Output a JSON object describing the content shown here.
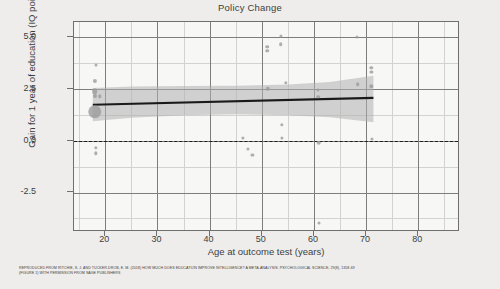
{
  "chart_data": {
    "type": "scatter",
    "title": "Policy Change",
    "xlabel": "Age at outcome test (years)",
    "ylabel": "Gain for 1 year of education\n(IQ points)",
    "ylabel_line1": "Gain for 1 year of education",
    "ylabel_line2": "(IQ points)",
    "xlim": [
      14,
      88
    ],
    "ylim": [
      -4.4,
      5.7
    ],
    "xticks": [
      20,
      30,
      40,
      50,
      60,
      70,
      80
    ],
    "xtick_labels": [
      "20",
      "30",
      "40",
      "50",
      "60",
      "70",
      "80"
    ],
    "yticks": [
      -2.5,
      0.0,
      2.5,
      5.0
    ],
    "ytick_labels": [
      "-2.5",
      "0.0",
      "2.5",
      "5.0"
    ],
    "x_minor_step": 5,
    "y_minor_step": 1.25,
    "grid": true,
    "legend": "none",
    "zero_reference_line": 0.0,
    "zero_line_style": "dashed",
    "regression_line": {
      "x_start": 17.6,
      "y_start": 1.72,
      "x_end": 71.4,
      "y_end": 2.05,
      "color": "#1a1a1a"
    },
    "confidence_band": {
      "color": "#b0b0b0",
      "opacity": 0.55,
      "upper": [
        {
          "x": 17.6,
          "y": 2.52
        },
        {
          "x": 25.0,
          "y": 2.6
        },
        {
          "x": 35.0,
          "y": 2.62
        },
        {
          "x": 45.0,
          "y": 2.63
        },
        {
          "x": 55.0,
          "y": 2.7
        },
        {
          "x": 63.0,
          "y": 2.82
        },
        {
          "x": 71.4,
          "y": 3.12
        }
      ],
      "lower": [
        {
          "x": 17.6,
          "y": 0.93
        },
        {
          "x": 25.0,
          "y": 1.1
        },
        {
          "x": 35.0,
          "y": 1.22
        },
        {
          "x": 45.0,
          "y": 1.26
        },
        {
          "x": 55.0,
          "y": 1.22
        },
        {
          "x": 63.0,
          "y": 1.12
        },
        {
          "x": 71.4,
          "y": 0.88
        }
      ]
    },
    "points": [
      {
        "x": 18.3,
        "y": 3.62,
        "size": 3.0
      },
      {
        "x": 18.0,
        "y": 2.88,
        "size": 4.2
      },
      {
        "x": 18.0,
        "y": 2.38,
        "size": 5.6
      },
      {
        "x": 18.0,
        "y": 2.12,
        "size": 4.0
      },
      {
        "x": 19.0,
        "y": 2.12,
        "size": 3.4
      },
      {
        "x": 18.0,
        "y": 1.38,
        "size": 13.5
      },
      {
        "x": 18.2,
        "y": -0.34,
        "size": 3.4
      },
      {
        "x": 18.2,
        "y": -0.62,
        "size": 3.4
      },
      {
        "x": 46.4,
        "y": 0.13,
        "size": 3.2
      },
      {
        "x": 47.3,
        "y": -0.42,
        "size": 3.2
      },
      {
        "x": 48.2,
        "y": -0.68,
        "size": 3.2
      },
      {
        "x": 51.0,
        "y": 4.52,
        "size": 3.6
      },
      {
        "x": 51.0,
        "y": 4.32,
        "size": 3.6
      },
      {
        "x": 51.2,
        "y": 2.48,
        "size": 4.4
      },
      {
        "x": 53.6,
        "y": 5.05,
        "size": 3.2
      },
      {
        "x": 53.6,
        "y": 4.62,
        "size": 3.6
      },
      {
        "x": 53.8,
        "y": 0.75,
        "size": 3.4
      },
      {
        "x": 53.8,
        "y": 0.12,
        "size": 3.2
      },
      {
        "x": 54.6,
        "y": 2.78,
        "size": 3.4
      },
      {
        "x": 60.8,
        "y": 2.42,
        "size": 3.2
      },
      {
        "x": 60.8,
        "y": 2.1,
        "size": 3.6
      },
      {
        "x": 60.9,
        "y": -0.1,
        "size": 4.6
      },
      {
        "x": 60.9,
        "y": -3.95,
        "size": 3.0
      },
      {
        "x": 68.3,
        "y": 4.98,
        "size": 3.0
      },
      {
        "x": 68.4,
        "y": 2.72,
        "size": 3.6
      },
      {
        "x": 71.0,
        "y": 3.5,
        "size": 3.4
      },
      {
        "x": 71.0,
        "y": 3.3,
        "size": 3.2
      },
      {
        "x": 71.0,
        "y": 2.6,
        "size": 3.4
      },
      {
        "x": 71.1,
        "y": 0.08,
        "size": 3.0
      }
    ]
  },
  "caption": {
    "line1": "REPRODUCED FROM RITCHIE, S. J. AND TUCKER-DROB, E. M. (2018) HOW MUCH DOES EDUCATION IMPROVE INTELLIGENCE? A META-ANALYSIS. PSYCHOLOGICAL SCIENCE, 29(8), 1358-69",
    "line2": "(FIGURE 1) WITH PERMISSION FROM SAGE PUBLISHERS"
  },
  "colors": {
    "background": "#eeedeb",
    "plot_background": "#f7f7f5",
    "point": "#9a9a9a",
    "band": "#b0b0b0",
    "fit_line": "#1a1a1a",
    "grid_major": "#7d7d7d",
    "grid_minor": "#d2d2cf"
  }
}
